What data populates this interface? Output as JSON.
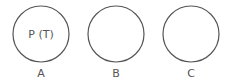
{
  "diagram": {
    "circles": [
      {
        "id": "A",
        "label": "A",
        "inner_text": "P (T)",
        "cx": 41,
        "cy": 34,
        "r": 28
      },
      {
        "id": "B",
        "label": "B",
        "inner_text": "",
        "cx": 116,
        "cy": 34,
        "r": 28
      },
      {
        "id": "C",
        "label": "C",
        "inner_text": "",
        "cx": 191,
        "cy": 34,
        "r": 28
      }
    ],
    "stroke_color": "#555555"
  }
}
